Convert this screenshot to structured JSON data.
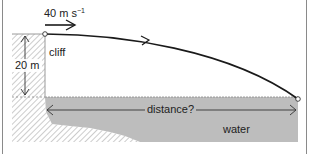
{
  "diagram": {
    "type": "projectile-from-cliff",
    "labels": {
      "velocity_value": "40 m s",
      "velocity_exponent": "−1",
      "cliff": "cliff",
      "height": "20 m",
      "distance": "distance?",
      "water": "water"
    },
    "colors": {
      "line": "#1a1a1a",
      "water": "#bdbdbd",
      "hatch": "#9a9a9a",
      "frame": "#8a8a8a",
      "text": "#222222"
    },
    "values": {
      "initial_speed_m_per_s": 40,
      "cliff_height_m": 20,
      "horizontal_distance": "unknown"
    }
  }
}
